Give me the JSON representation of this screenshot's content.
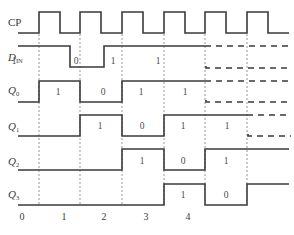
{
  "diagram": {
    "type": "timing-diagram",
    "signals": [
      {
        "name": "CP",
        "label": "CP",
        "subscript": ""
      },
      {
        "name": "D_IN",
        "label": "D",
        "subscript": "IN"
      },
      {
        "name": "Q0",
        "label": "Q",
        "subscript": "0"
      },
      {
        "name": "Q1",
        "label": "Q",
        "subscript": "1"
      },
      {
        "name": "Q2",
        "label": "Q",
        "subscript": "2"
      },
      {
        "name": "Q3",
        "label": "Q",
        "subscript": "3"
      }
    ],
    "values": {
      "D_IN": [
        "1",
        "0",
        "1",
        "1"
      ],
      "Q0": [
        "1",
        "0",
        "1",
        "1"
      ],
      "Q1": [
        "1",
        "0",
        "1",
        "1"
      ],
      "Q2": [
        "1",
        "0",
        "1"
      ],
      "Q3": [
        "1",
        "0"
      ]
    },
    "clock_ticks": [
      "0",
      "1",
      "2",
      "3",
      "4"
    ],
    "colors": {
      "line": "#3a3a3a",
      "grid": "#8a8a8a",
      "background": "#ffffff"
    }
  }
}
